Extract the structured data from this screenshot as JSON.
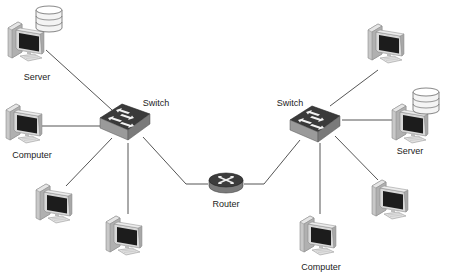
{
  "diagram": {
    "type": "network-topology",
    "colors": {
      "line": "#555555",
      "device_body": "#d4d4d4",
      "device_shade": "#9a9a9a",
      "screen": "#1c1c1c",
      "switch_top": "#3a3a3a",
      "switch_side": "#8a8a8a",
      "router_top": "#3c3c3c",
      "router_side": "#7a7a7a",
      "arrow": "#f2f2f2",
      "disk": "#f4f4f4"
    },
    "nodes": [
      {
        "id": "left-server",
        "kind": "server",
        "label": "Server"
      },
      {
        "id": "left-computer",
        "kind": "computer",
        "label": "Computer"
      },
      {
        "id": "left-pc-1",
        "kind": "computer",
        "label": ""
      },
      {
        "id": "left-pc-2",
        "kind": "computer",
        "label": ""
      },
      {
        "id": "left-switch",
        "kind": "switch",
        "label": "Switch"
      },
      {
        "id": "router",
        "kind": "router",
        "label": "Router"
      },
      {
        "id": "right-switch",
        "kind": "switch",
        "label": "Switch"
      },
      {
        "id": "right-pc-top",
        "kind": "computer",
        "label": ""
      },
      {
        "id": "right-server",
        "kind": "server",
        "label": "Server"
      },
      {
        "id": "right-pc-mid",
        "kind": "computer",
        "label": ""
      },
      {
        "id": "right-computer",
        "kind": "computer",
        "label": "Computer"
      }
    ],
    "links": [
      [
        "left-server",
        "left-switch"
      ],
      [
        "left-computer",
        "left-switch"
      ],
      [
        "left-pc-1",
        "left-switch"
      ],
      [
        "left-pc-2",
        "left-switch"
      ],
      [
        "left-switch",
        "router"
      ],
      [
        "router",
        "right-switch"
      ],
      [
        "right-switch",
        "right-pc-top"
      ],
      [
        "right-switch",
        "right-server"
      ],
      [
        "right-switch",
        "right-pc-mid"
      ],
      [
        "right-switch",
        "right-computer"
      ]
    ]
  },
  "labels": {
    "left_server": "Server",
    "left_computer": "Computer",
    "left_switch": "Switch",
    "router": "Router",
    "right_switch": "Switch",
    "right_server": "Server",
    "right_computer": "Computer"
  }
}
